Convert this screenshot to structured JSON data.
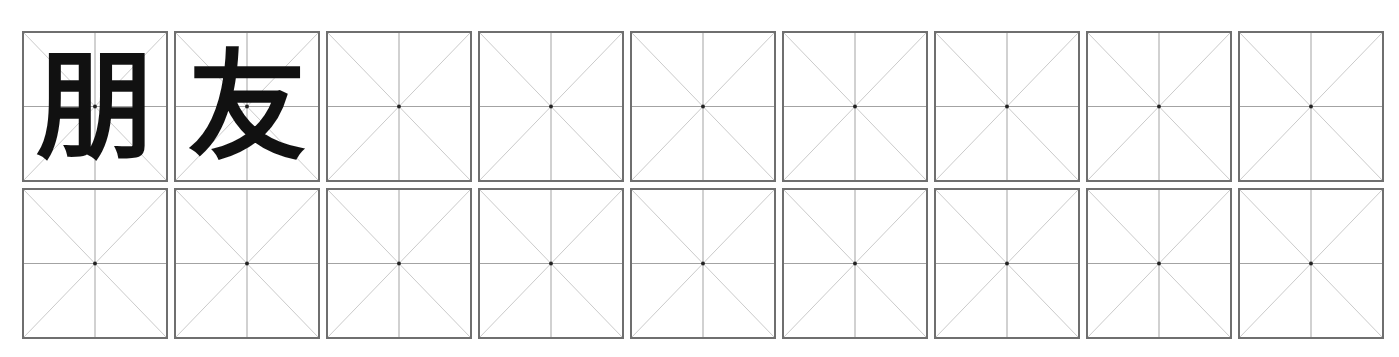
{
  "worksheet": {
    "type": "mi-zi-ge character practice grid",
    "colors": {
      "border": "#6f6f6f",
      "midline": "#a0a0a0",
      "diagonal": "#c8c8c8",
      "center_dot": "#222222",
      "glyph": "#111111"
    },
    "rows": [
      {
        "cells": [
          {
            "char": "朋"
          },
          {
            "char": "友"
          },
          {
            "char": ""
          },
          {
            "char": ""
          },
          {
            "char": ""
          },
          {
            "char": ""
          },
          {
            "char": ""
          },
          {
            "char": ""
          },
          {
            "char": ""
          }
        ]
      },
      {
        "cells": [
          {
            "char": ""
          },
          {
            "char": ""
          },
          {
            "char": ""
          },
          {
            "char": ""
          },
          {
            "char": ""
          },
          {
            "char": ""
          },
          {
            "char": ""
          },
          {
            "char": ""
          },
          {
            "char": ""
          }
        ]
      }
    ]
  }
}
